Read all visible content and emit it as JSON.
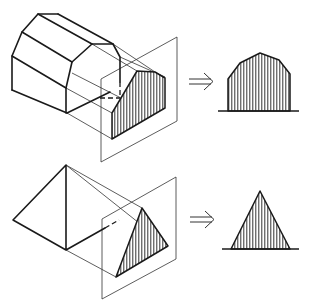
{
  "figure": {
    "rows": [
      {
        "name": "barn",
        "solid": "gambrel-roof prism",
        "arrow_icon": "double-arrow-right-icon",
        "result_shape": "gambrel pentagon (hatched)"
      },
      {
        "name": "pyramid",
        "solid": "triangular prism / pyramid",
        "arrow_icon": "double-arrow-right-icon",
        "result_shape": "triangle (hatched)"
      }
    ]
  },
  "colors": {
    "line": "#1a1a1a",
    "background": "#ffffff"
  }
}
